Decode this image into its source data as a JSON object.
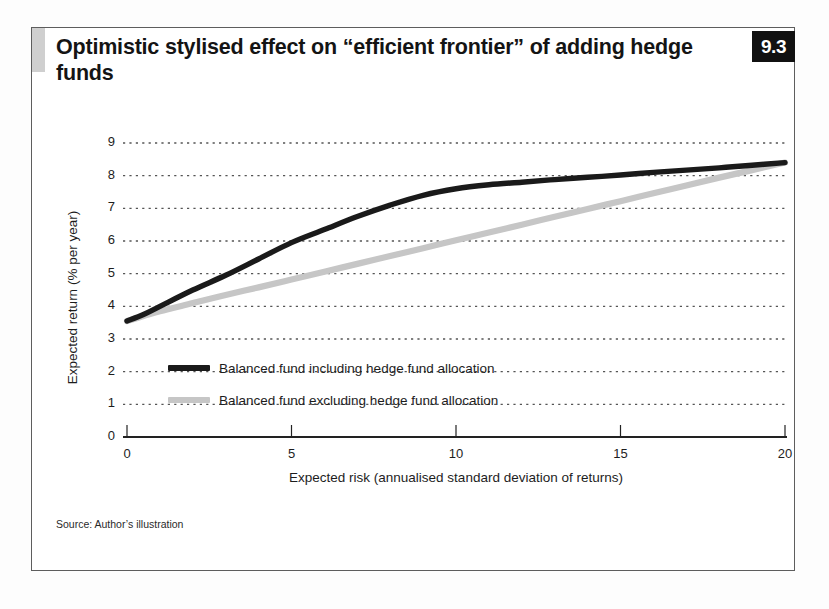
{
  "figure": {
    "number": "9.3",
    "title": "Optimistic stylised effect on “efficient frontier” of adding hedge funds",
    "source": "Source: Author’s illustration"
  },
  "colors": {
    "series_including": "#1a1a1a",
    "series_excluding": "#c6c6c6",
    "frame": "#5d5d5d",
    "accent_bar": "#cfcfcf",
    "badge_bg": "#111111",
    "badge_text": "#ffffff",
    "gridline": "#555555",
    "axis": "#222222"
  },
  "chart_data": {
    "type": "line",
    "title": "Optimistic stylised effect on “efficient frontier” of adding hedge funds",
    "xlabel": "Expected risk (annualised standard deviation of returns)",
    "ylabel": "Expected return (% per year)",
    "xlim": [
      0,
      20
    ],
    "ylim": [
      0,
      9
    ],
    "xticks": [
      0,
      5,
      10,
      15,
      20
    ],
    "yticks": [
      0,
      1,
      2,
      3,
      4,
      5,
      6,
      7,
      8,
      9
    ],
    "grid": "horizontal-dotted",
    "legend_position": "inside-lower-left",
    "series": [
      {
        "name": "Balanced fund including hedge fund allocation",
        "color": "#1a1a1a",
        "x": [
          0,
          0.5,
          1,
          2,
          3,
          4,
          5,
          6,
          7,
          8,
          9,
          10,
          11,
          12,
          13,
          14,
          15,
          16,
          17,
          18,
          19,
          20
        ],
        "y": [
          3.55,
          3.75,
          4.0,
          4.5,
          4.95,
          5.45,
          5.95,
          6.35,
          6.75,
          7.1,
          7.4,
          7.6,
          7.72,
          7.8,
          7.88,
          7.95,
          8.02,
          8.1,
          8.17,
          8.24,
          8.32,
          8.4
        ]
      },
      {
        "name": "Balanced fund excluding hedge fund allocation",
        "color": "#c6c6c6",
        "x": [
          0,
          0.5,
          1,
          2,
          3,
          4,
          5,
          6,
          7,
          8,
          9,
          10,
          11,
          12,
          13,
          14,
          15,
          16,
          17,
          18,
          19,
          20
        ],
        "y": [
          3.55,
          3.7,
          3.85,
          4.1,
          4.35,
          4.58,
          4.82,
          5.06,
          5.3,
          5.54,
          5.78,
          6.02,
          6.26,
          6.5,
          6.74,
          6.98,
          7.22,
          7.46,
          7.7,
          7.94,
          8.17,
          8.4
        ]
      }
    ],
    "legend": [
      {
        "label": "Balanced fund including hedge fund allocation",
        "color": "#1a1a1a"
      },
      {
        "label": "Balanced fund excluding hedge fund allocation",
        "color": "#c6c6c6"
      }
    ]
  }
}
